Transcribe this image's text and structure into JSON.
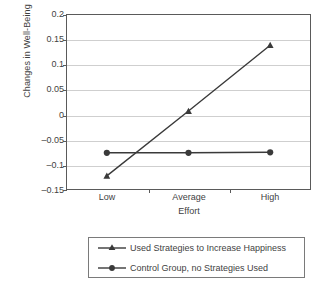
{
  "chart_data": {
    "type": "line",
    "title": "",
    "xlabel": "Effort",
    "ylabel": "Changes in Well-Being",
    "categories": [
      "Low",
      "Average",
      "High"
    ],
    "ylim": [
      -0.15,
      0.2
    ],
    "yticks": [
      "-0.15",
      "-0.1",
      "-0.05",
      "0",
      "0.05",
      "0.1",
      "0.15",
      "0.2"
    ],
    "ytick_values": [
      -0.15,
      -0.1,
      -0.05,
      0,
      0.05,
      0.1,
      0.15,
      0.2
    ],
    "grid": true,
    "legend_position": "bottom",
    "series": [
      {
        "name": "Used Strategies to Increase Happiness",
        "marker": "triangle",
        "color": "#3a3a3a",
        "values": [
          -0.122,
          0.007,
          0.138
        ]
      },
      {
        "name": "Control Group, no Strategies Used",
        "marker": "circle",
        "color": "#3a3a3a",
        "values": [
          -0.076,
          -0.076,
          -0.075
        ]
      }
    ]
  },
  "axes": {
    "y_title": "Changes in Well-Being",
    "x_title": "Effort",
    "y_labels": [
      "0.2",
      "0.15",
      "0.1",
      "0.05",
      "0",
      "–0.05",
      "–0.1",
      "–0.15"
    ],
    "x_labels": [
      "Low",
      "Average",
      "High"
    ]
  },
  "legend": {
    "items": [
      {
        "label": "Used Strategies to Increase Happiness",
        "marker": "triangle-marker-icon"
      },
      {
        "label": "Control Group, no Strategies Used",
        "marker": "circle-marker-icon"
      }
    ]
  },
  "colors": {
    "series": "#3a3a3a",
    "grid": "#cfcfcf",
    "frame": "#5a5a5a",
    "text": "#3f3f3f"
  }
}
